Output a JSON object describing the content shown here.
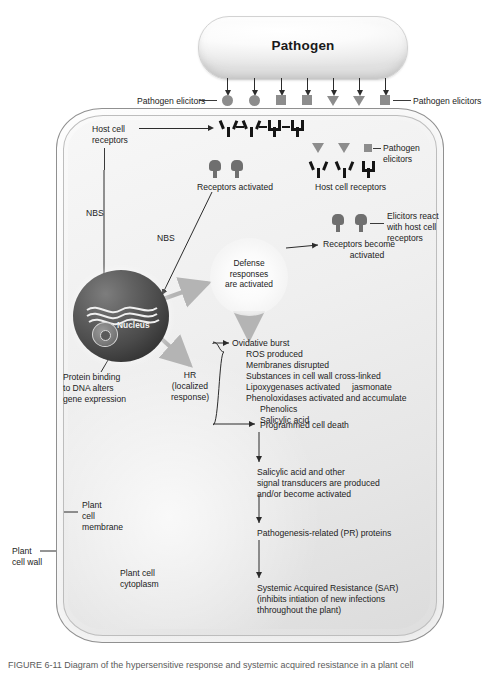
{
  "figure": {
    "caption": "FIGURE 6-11  Diagram of the hypersensitive response and systemic acquired resistance in a plant cell"
  },
  "pathogen": {
    "label": "Pathogen"
  },
  "elicitors": {
    "left_label": "Pathogen elicitors",
    "right_label": "Pathogen elicitors",
    "inner_label_line1": "Pathogen",
    "inner_label_line2": "elicitors",
    "shapes": [
      "circle",
      "circle",
      "square",
      "square",
      "triangle",
      "triangle",
      "square"
    ],
    "color": "#8d8d8d"
  },
  "cell": {
    "wall_label_line1": "Plant",
    "wall_label_line2": "cell wall",
    "membrane_label_line1": "Plant",
    "membrane_label_line2": "cell",
    "membrane_label_line3": "membrane",
    "cytoplasm_label_line1": "Plant cell",
    "cytoplasm_label_line2": "cytoplasm"
  },
  "receptors": {
    "host_cell_receptors_left_line1": "Host cell",
    "host_cell_receptors_left_line2": "receptors",
    "host_cell_receptors_right": "Host cell receptors",
    "receptors_activated": "Receptors activated",
    "receptors_become_activated_line1": "Receptors become",
    "receptors_become_activated_line2": "activated",
    "elicitors_react_line1": "Elicitors react",
    "elicitors_react_line2": "with host cell",
    "elicitors_react_line3": "receptors"
  },
  "signaling": {
    "nbs_left": "NBS",
    "nbs_right": "NBS",
    "nucleus_label": "Nucleus",
    "protein_binding_line1": "Protein binding",
    "protein_binding_line2": "to DNA alters",
    "protein_binding_line3": "gene expression",
    "defense_line1": "Defense",
    "defense_line2": "responses",
    "defense_line3": "are activated",
    "hr_line1": "HR",
    "hr_line2": "(localized",
    "hr_line3": "response)"
  },
  "responses": {
    "items": [
      "Ovidative burst",
      "ROS produced",
      "Membranes disrupted",
      "Substances in cell wall cross-linked",
      "Lipoxygenases activated     jasmonate",
      "Phenoloxidases activated and accumulate",
      "Phenolics",
      "Salicylic acid"
    ],
    "programmed_cell_death": "Programmed cell death"
  },
  "cascade": {
    "step1_line1": "Salicylic acid and other",
    "step1_line2": "signal transducers are produced",
    "step1_line3": "and/or become activated",
    "step2": "Pathogenesis-related (PR) proteins",
    "step3_line1": "Systemic Acquired Resistance (SAR)",
    "step3_line2": "(inhibits intiation of new infections",
    "step3_line3": "thhroughout the plant)"
  }
}
